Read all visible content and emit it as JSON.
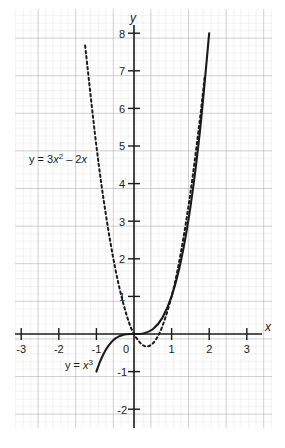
{
  "chart_data": {
    "type": "line",
    "title": "",
    "xlabel": "x",
    "ylabel": "y",
    "xlim": [
      -3.4,
      3.5
    ],
    "ylim": [
      -2.5,
      8.2
    ],
    "grid": true,
    "grid_minor_step": 0.2,
    "grid_major_step": 1,
    "legend": "inline-annotations",
    "x_ticks": [
      "-3",
      "-2",
      "-1",
      "0",
      "1",
      "2",
      "3"
    ],
    "x_tick_values": [
      -3,
      -2,
      -1,
      0,
      1,
      2,
      3
    ],
    "y_ticks": [
      "8",
      "7",
      "6",
      "5",
      "4",
      "3",
      "2",
      "1",
      "-1",
      "-2"
    ],
    "y_tick_values": [
      8,
      7,
      6,
      5,
      4,
      3,
      2,
      1,
      -1,
      -2
    ],
    "series": [
      {
        "name": "y = x^3",
        "label": "y = x",
        "label_exponent": "3",
        "style": "solid",
        "color": "#1a1a1a",
        "domain": [
          -1.02,
          2.0
        ],
        "equation": "x**3",
        "points": [
          {
            "x": -1.0,
            "y": -1.0
          },
          {
            "x": -0.9,
            "y": -0.729
          },
          {
            "x": -0.8,
            "y": -0.512
          },
          {
            "x": -0.7,
            "y": -0.343
          },
          {
            "x": -0.6,
            "y": -0.216
          },
          {
            "x": -0.5,
            "y": -0.125
          },
          {
            "x": -0.4,
            "y": -0.064
          },
          {
            "x": -0.3,
            "y": -0.027
          },
          {
            "x": -0.2,
            "y": -0.008
          },
          {
            "x": -0.1,
            "y": -0.001
          },
          {
            "x": 0.0,
            "y": 0.0
          },
          {
            "x": 0.25,
            "y": 0.016
          },
          {
            "x": 0.5,
            "y": 0.125
          },
          {
            "x": 0.75,
            "y": 0.422
          },
          {
            "x": 1.0,
            "y": 1.0
          },
          {
            "x": 1.25,
            "y": 1.953
          },
          {
            "x": 1.5,
            "y": 3.375
          },
          {
            "x": 1.75,
            "y": 5.359
          },
          {
            "x": 2.0,
            "y": 8.0
          }
        ]
      },
      {
        "name": "y = 3x^2 - 2x",
        "label": "y = 3x",
        "label_exponent": "2",
        "label_tail": " – 2x",
        "style": "dashed",
        "color": "#1a1a1a",
        "domain": [
          -1.3,
          1.88
        ],
        "equation": "3*x**2 - 2*x",
        "points": [
          {
            "x": -1.3,
            "y": 7.67
          },
          {
            "x": -1.0,
            "y": 5.0
          },
          {
            "x": -0.75,
            "y": 3.188
          },
          {
            "x": -0.5,
            "y": 1.75
          },
          {
            "x": -0.25,
            "y": 0.688
          },
          {
            "x": 0.0,
            "y": 0.0
          },
          {
            "x": 0.333,
            "y": -0.333
          },
          {
            "x": 0.667,
            "y": 0.0
          },
          {
            "x": 1.0,
            "y": 1.0
          },
          {
            "x": 1.25,
            "y": 2.188
          },
          {
            "x": 1.5,
            "y": 3.75
          },
          {
            "x": 1.75,
            "y": 5.688
          },
          {
            "x": 1.88,
            "y": 6.84
          }
        ]
      }
    ],
    "annotations": [
      {
        "name": "parabola-label",
        "text": "y = 3x² – 2x",
        "x": -2.08,
        "y": 4.55
      },
      {
        "name": "cubic-label",
        "text": "y = x³",
        "x": -1.72,
        "y": -0.93
      }
    ]
  },
  "axes": {
    "x_axis_name": "x",
    "y_axis_name": "y"
  }
}
